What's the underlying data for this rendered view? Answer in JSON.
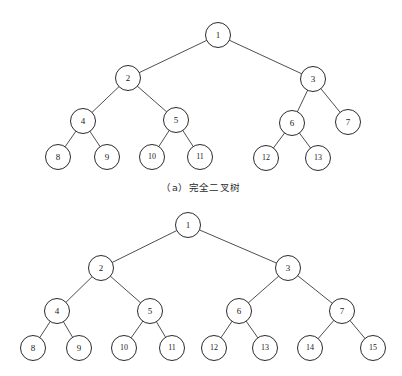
{
  "figure": {
    "background_color": "#ffffff",
    "stroke_color": "#2b2b2b",
    "edge_color": "#3a3a3a",
    "node_fill": "#ffffff",
    "node_radius": 12.5,
    "caption_a": "（a）完全二叉树"
  },
  "chart_data": {
    "type": "diagram",
    "diagrams": [
      {
        "id": "complete-binary-tree",
        "caption": "（a）完全二叉树",
        "node_count": 13,
        "depth": 4,
        "nodes": [
          {
            "id": 1,
            "label": "1",
            "x": 218,
            "y": 35,
            "level": 1,
            "parent": null
          },
          {
            "id": 2,
            "label": "2",
            "x": 128,
            "y": 78,
            "level": 2,
            "parent": 1
          },
          {
            "id": 3,
            "label": "3",
            "x": 313,
            "y": 79,
            "level": 2,
            "parent": 1
          },
          {
            "id": 4,
            "label": "4",
            "x": 83,
            "y": 121,
            "level": 3,
            "parent": 2
          },
          {
            "id": 5,
            "label": "5",
            "x": 176,
            "y": 120,
            "level": 3,
            "parent": 2
          },
          {
            "id": 6,
            "label": "6",
            "x": 292,
            "y": 123,
            "level": 3,
            "parent": 3
          },
          {
            "id": 7,
            "label": "7",
            "x": 348,
            "y": 122,
            "level": 3,
            "parent": 3
          },
          {
            "id": 8,
            "label": "8",
            "x": 58,
            "y": 157,
            "level": 4,
            "parent": 4
          },
          {
            "id": 9,
            "label": "9",
            "x": 107,
            "y": 157,
            "level": 4,
            "parent": 4
          },
          {
            "id": 10,
            "label": "10",
            "x": 152,
            "y": 157,
            "level": 4,
            "parent": 5
          },
          {
            "id": 11,
            "label": "11",
            "x": 200,
            "y": 157,
            "level": 4,
            "parent": 5
          },
          {
            "id": 12,
            "label": "12",
            "x": 266,
            "y": 158,
            "level": 4,
            "parent": 6
          },
          {
            "id": 13,
            "label": "13",
            "x": 318,
            "y": 158,
            "level": 4,
            "parent": 6
          }
        ],
        "edges": [
          [
            1,
            2
          ],
          [
            1,
            3
          ],
          [
            2,
            4
          ],
          [
            2,
            5
          ],
          [
            3,
            6
          ],
          [
            3,
            7
          ],
          [
            4,
            8
          ],
          [
            4,
            9
          ],
          [
            5,
            10
          ],
          [
            5,
            11
          ],
          [
            6,
            12
          ],
          [
            6,
            13
          ]
        ]
      },
      {
        "id": "full-binary-tree",
        "caption": "",
        "node_count": 15,
        "depth": 4,
        "nodes": [
          {
            "id": 1,
            "label": "1",
            "x": 188,
            "y": 225,
            "level": 1,
            "parent": null
          },
          {
            "id": 2,
            "label": "2",
            "x": 101,
            "y": 268,
            "level": 2,
            "parent": 1
          },
          {
            "id": 3,
            "label": "3",
            "x": 288,
            "y": 268,
            "level": 2,
            "parent": 1
          },
          {
            "id": 4,
            "label": "4",
            "x": 57,
            "y": 311,
            "level": 3,
            "parent": 2
          },
          {
            "id": 5,
            "label": "5",
            "x": 150,
            "y": 311,
            "level": 3,
            "parent": 2
          },
          {
            "id": 6,
            "label": "6",
            "x": 239,
            "y": 311,
            "level": 3,
            "parent": 3
          },
          {
            "id": 7,
            "label": "7",
            "x": 342,
            "y": 311,
            "level": 3,
            "parent": 3
          },
          {
            "id": 8,
            "label": "8",
            "x": 33,
            "y": 348,
            "level": 4,
            "parent": 4
          },
          {
            "id": 9,
            "label": "9",
            "x": 79,
            "y": 348,
            "level": 4,
            "parent": 4
          },
          {
            "id": 10,
            "label": "10",
            "x": 124,
            "y": 348,
            "level": 4,
            "parent": 5
          },
          {
            "id": 11,
            "label": "11",
            "x": 172,
            "y": 348,
            "level": 4,
            "parent": 5
          },
          {
            "id": 12,
            "label": "12",
            "x": 214,
            "y": 348,
            "level": 4,
            "parent": 6
          },
          {
            "id": 13,
            "label": "13",
            "x": 265,
            "y": 348,
            "level": 4,
            "parent": 6
          },
          {
            "id": 14,
            "label": "14",
            "x": 310,
            "y": 348,
            "level": 4,
            "parent": 7
          },
          {
            "id": 15,
            "label": "15",
            "x": 373,
            "y": 348,
            "level": 4,
            "parent": 7
          }
        ],
        "edges": [
          [
            1,
            2
          ],
          [
            1,
            3
          ],
          [
            2,
            4
          ],
          [
            2,
            5
          ],
          [
            3,
            6
          ],
          [
            3,
            7
          ],
          [
            4,
            8
          ],
          [
            4,
            9
          ],
          [
            5,
            10
          ],
          [
            5,
            11
          ],
          [
            6,
            12
          ],
          [
            6,
            13
          ],
          [
            7,
            14
          ],
          [
            7,
            15
          ]
        ]
      }
    ]
  }
}
